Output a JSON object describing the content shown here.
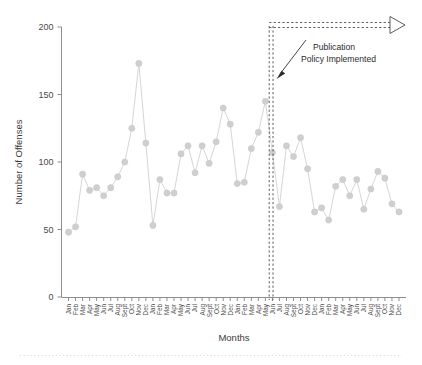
{
  "chart_data": {
    "type": "line",
    "title": "",
    "xlabel": "Months",
    "ylabel": "Number of Offenses",
    "ylim": [
      0,
      200
    ],
    "yticks": [
      0,
      50,
      100,
      150,
      200
    ],
    "grid": false,
    "legend": null,
    "marker": "circle",
    "series_color": "#cfcfcf",
    "categories": [
      "Jan",
      "Feb",
      "Mar",
      "Apr",
      "May",
      "Jun",
      "Jul",
      "Aug",
      "Sept",
      "Oct",
      "Nov",
      "Dec",
      "Jan",
      "Feb",
      "Mar",
      "Apr",
      "May",
      "Jun",
      "Jul",
      "Aug",
      "Sept",
      "Oct",
      "Nov",
      "Dec",
      "Jan",
      "Feb",
      "Mar",
      "Apr",
      "May",
      "Jun",
      "Jul",
      "Aug",
      "Sept",
      "Oct",
      "Nov",
      "Dec",
      "Jan",
      "Feb",
      "Mar",
      "Apr",
      "May",
      "Jun",
      "Jul",
      "Aug",
      "Sept",
      "Oct",
      "Nov",
      "Dec"
    ],
    "values": [
      48,
      52,
      91,
      79,
      81,
      75,
      81,
      89,
      100,
      125,
      173,
      114,
      53,
      87,
      77,
      77,
      106,
      112,
      92,
      112,
      99,
      115,
      140,
      128,
      84,
      85,
      110,
      122,
      145,
      107,
      67,
      112,
      104,
      118,
      95,
      63,
      66,
      57,
      82,
      87,
      75,
      87,
      65,
      80,
      93,
      88,
      69,
      63
    ],
    "annotations": [
      {
        "name": "publication-policy-annotation",
        "line1": "Publication",
        "line2": "Policy Implemented",
        "points_to_category_index": 29
      }
    ],
    "event_marker": {
      "name": "policy-implementation-rule",
      "style": "double-dashed-vertical",
      "at_category_index": 29,
      "span_style": "dashed-horizontal-with-open-arrowhead",
      "span_from_index": 29,
      "span_to": "end"
    }
  },
  "axes": {
    "y_title": "Number of Offenses",
    "x_title": "Months",
    "y_tick_labels": [
      "0",
      "50",
      "100",
      "150",
      "200"
    ]
  }
}
